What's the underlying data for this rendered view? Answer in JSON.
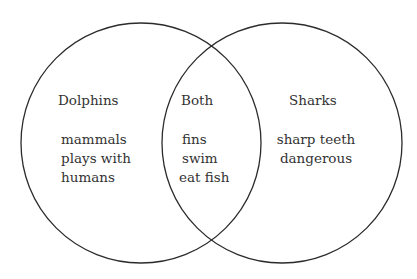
{
  "diagram": {
    "type": "venn",
    "stroke_color": "#2b2b2b",
    "sets": [
      {
        "name": "Dolphins",
        "items": [
          "mammals",
          "plays with",
          "humans"
        ]
      },
      {
        "name": "Sharks",
        "items": [
          "sharp teeth",
          "dangerous"
        ]
      }
    ],
    "intersection": {
      "name": "Both",
      "items": [
        "fins",
        "swim",
        "eat fish"
      ]
    }
  }
}
